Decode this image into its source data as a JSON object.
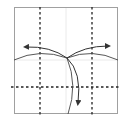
{
  "diagram": {
    "type": "origami-fold-step",
    "paper": {
      "x": 14,
      "y": 7,
      "width": 104,
      "height": 106,
      "stroke": "#9a9a9a",
      "fill": "#ffffff"
    },
    "crease_lines": [
      {
        "orientation": "vertical",
        "x": 66,
        "stroke": "#e2e2e2"
      },
      {
        "orientation": "horizontal",
        "y": 60,
        "stroke": "#e2e2e2"
      }
    ],
    "valley_folds": [
      {
        "orientation": "vertical",
        "x": 40,
        "stroke": "#222222"
      },
      {
        "orientation": "vertical",
        "x": 92,
        "stroke": "#222222"
      },
      {
        "orientation": "horizontal",
        "y": 87,
        "stroke": "#222222"
      }
    ],
    "fold_arrows": [
      {
        "direction": "left",
        "label": "fold-left"
      },
      {
        "direction": "right",
        "label": "fold-right"
      },
      {
        "direction": "down",
        "label": "fold-down"
      }
    ],
    "colors": {
      "line": "#333333",
      "arrowhead": "#333333"
    }
  }
}
